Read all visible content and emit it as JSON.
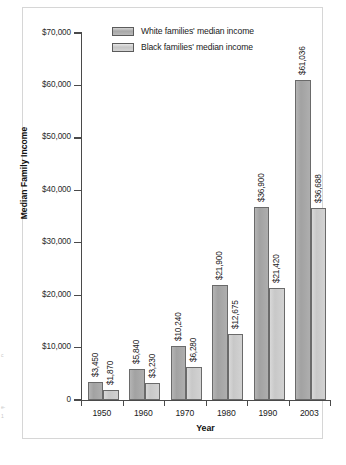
{
  "chart_data": {
    "type": "bar",
    "title": "",
    "xlabel": "Year",
    "ylabel": "Median Family Income",
    "categories": [
      "1950",
      "1960",
      "1970",
      "1980",
      "1990",
      "2003"
    ],
    "ylim": [
      0,
      70000
    ],
    "ytick_values": [
      70000,
      60000,
      50000,
      40000,
      30000,
      20000,
      10000,
      0
    ],
    "ytick_labels": [
      "$70,000",
      "$60,000",
      "$50,000",
      "$40,000",
      "$30,000",
      "$20,000",
      "$10,000",
      "0"
    ],
    "grid": false,
    "legend_position": "top-center-inside",
    "series": [
      {
        "name": "White families' median income",
        "color": "#a8a8a8",
        "values": [
          3450,
          5840,
          10240,
          21900,
          36900,
          61036
        ],
        "labels": [
          "$3,450",
          "$5,840",
          "$10,240",
          "$21,900",
          "$36,900",
          "$61,036"
        ]
      },
      {
        "name": "Black families' median income",
        "color": "#cecece",
        "values": [
          1870,
          3230,
          6280,
          12675,
          21420,
          36688
        ],
        "labels": [
          "$1,870",
          "$3,230",
          "$6,280",
          "$12,675",
          "$21,420",
          "$36,688"
        ]
      }
    ]
  },
  "margin_scraps": {
    "line1": "c",
    "line2": "e-",
    "line3": "1"
  }
}
